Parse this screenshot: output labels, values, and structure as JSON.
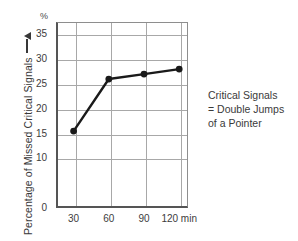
{
  "chart_data": {
    "type": "line",
    "title": "",
    "subtitle": "",
    "xlabel": "",
    "ylabel": "Percentage of Missed Critical Signals",
    "yunit": "%",
    "x": [
      30,
      60,
      90,
      120
    ],
    "categories": [
      "30",
      "60",
      "90",
      "120 min"
    ],
    "values": [
      15.5,
      26,
      27,
      28
    ],
    "series": [
      {
        "name": "Percentage of Missed Critical Signals",
        "values": [
          15.5,
          26,
          27,
          28
        ]
      }
    ],
    "xlim": [
      15,
      127.5
    ],
    "ylim": [
      0,
      37.5
    ],
    "xticks": [
      30,
      60,
      90,
      120
    ],
    "xticklabels": [
      "30",
      "60",
      "90",
      "120 min"
    ],
    "yticks": [
      0,
      10,
      15,
      20,
      25,
      30,
      35
    ],
    "yticklabels": [
      "0",
      "10",
      "15",
      "20",
      "25",
      "30",
      "35"
    ],
    "grid": true,
    "legend": "none",
    "marker": "filled-circle",
    "line_color": "#1a1a1a",
    "grid_color": "#a8a8a8",
    "axis_color": "#555555",
    "annotations": [
      "Critical Signals",
      "= Double Jumps",
      "of a Pointer"
    ]
  },
  "axis": {
    "unit_caption": "%",
    "y_title": "Percentage of Missed Critical Signals"
  },
  "annotation": {
    "line1": "Critical Signals",
    "line2": "= Double Jumps",
    "line3": "of a Pointer"
  }
}
